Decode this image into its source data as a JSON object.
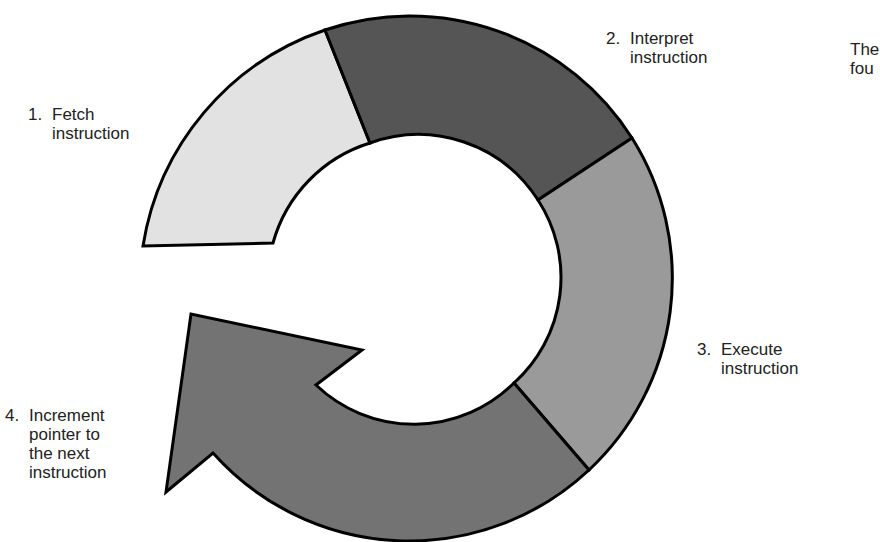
{
  "diagram": {
    "title_fragment": [
      "The",
      "fou"
    ],
    "steps": [
      {
        "number": "1.",
        "lines": [
          "Fetch",
          "instruction"
        ],
        "color": "#e2e2e2"
      },
      {
        "number": "2.",
        "lines": [
          "Interpret",
          "instruction"
        ],
        "color": "#555555"
      },
      {
        "number": "3.",
        "lines": [
          "Execute",
          "instruction"
        ],
        "color": "#9a9a9a"
      },
      {
        "number": "4.",
        "lines": [
          "Increment",
          "pointer to",
          "the next",
          "instruction"
        ],
        "color": "#737373"
      }
    ],
    "outline_color": "#000000"
  }
}
